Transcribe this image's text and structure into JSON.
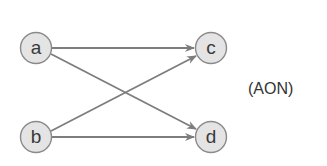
{
  "diagram": {
    "type": "activity-on-node network",
    "caption": "(AON)",
    "nodes": [
      {
        "id": "a",
        "label": "a",
        "x": 36,
        "y": 48
      },
      {
        "id": "b",
        "label": "b",
        "x": 36,
        "y": 137
      },
      {
        "id": "c",
        "label": "c",
        "x": 211,
        "y": 48
      },
      {
        "id": "d",
        "label": "d",
        "x": 211,
        "y": 137
      }
    ],
    "edges": [
      {
        "from": "a",
        "to": "c"
      },
      {
        "from": "a",
        "to": "d"
      },
      {
        "from": "b",
        "to": "c"
      },
      {
        "from": "b",
        "to": "d"
      }
    ],
    "colors": {
      "node_fill": "#e4e4e4",
      "node_stroke": "#8a8a8a",
      "edge": "#7d7d7d"
    }
  }
}
